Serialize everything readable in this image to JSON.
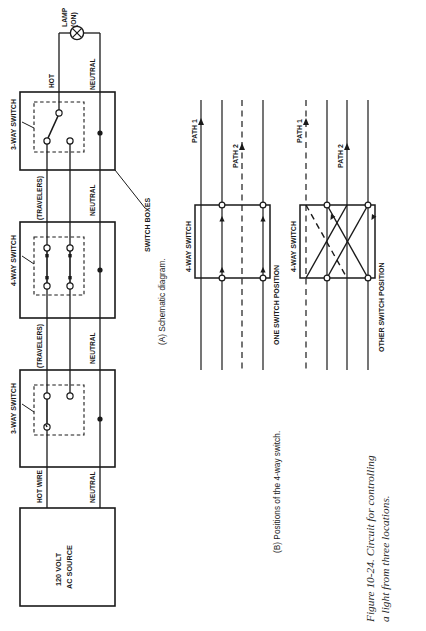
{
  "figure": {
    "caption_line1": "Figure 10-24. Circuit for controlling",
    "caption_line2": "a light from three locations."
  },
  "panel_a": {
    "caption": "(A) Schematic diagram.",
    "source_box": {
      "line1": "120 VOLT",
      "line2": "AC SOURCE"
    },
    "lamp": {
      "line1": "LAMP",
      "line2": "(ON)",
      "icon": "lamp-icon"
    },
    "wire_labels": {
      "hot_wire": "HOT WIRE",
      "hot": "HOT",
      "neutral_source": "NEUTRAL",
      "neutral_mid": "NEUTRAL",
      "neutral_top": "NEUTRAL",
      "neutral_lamp": "NEUTRAL",
      "travelers_lower": "(TRAVELERS)",
      "travelers_upper": "(TRAVELERS)"
    },
    "switches": [
      {
        "label": "3-WAY SWITCH",
        "type": "three-way-switch-lower"
      },
      {
        "label": "4-WAY SWITCH",
        "type": "four-way-switch-middle"
      },
      {
        "label": "3-WAY SWITCH",
        "type": "three-way-switch-upper"
      }
    ],
    "callout": "SWITCH BOXES"
  },
  "panel_b": {
    "caption": "(B) Positions of the 4-way switch.",
    "diagrams": [
      {
        "switch_label": "4-WAY SWITCH",
        "position_label": "ONE SWITCH POSITION",
        "path1_label": "PATH 1",
        "path2_label": "PATH 2",
        "wiring": "straight-through"
      },
      {
        "switch_label": "4-WAY SWITCH",
        "position_label": "OTHER SWITCH POSITION",
        "path1_label": "PATH 1",
        "path2_label": "PATH 2",
        "wiring": "crossed"
      }
    ]
  },
  "colors": {
    "ink": "#1a1a1a",
    "paper": "#ffffff"
  }
}
